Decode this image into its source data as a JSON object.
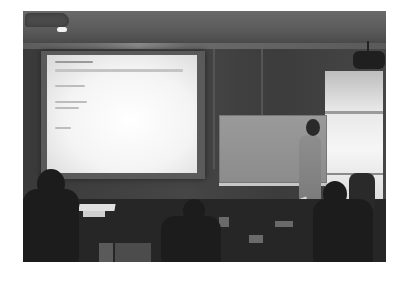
{
  "image": {
    "description": "Grayscale photograph of a lecture room: a presenter stands beside a whiteboard while a slide is projected on a screen; audience members sit in the foreground.",
    "style": "grayscale, low resolution, slightly blurred"
  },
  "scene": {
    "projection_screen": {
      "slide_text_legible": false,
      "slide_lines": 6
    },
    "whiteboard": {
      "content": "blank"
    },
    "presenter": {
      "position": "right of whiteboard, facing left"
    },
    "window": {
      "position": "right wall",
      "brightness": "bright"
    },
    "projector": {
      "position": "ceiling, upper right"
    },
    "ceiling_light": {
      "position": "upper left"
    },
    "audience_visible": 3
  },
  "colors": {
    "screen": "#f4f4f4",
    "wall": "#424242",
    "floor": "#262626",
    "whiteboard": "#909090",
    "window": "#ececec"
  }
}
